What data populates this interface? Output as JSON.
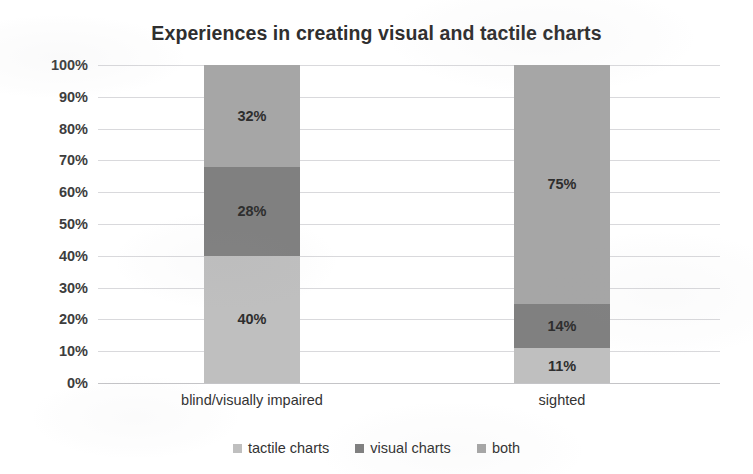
{
  "chart_data": {
    "type": "bar",
    "subtype": "100% stacked column",
    "title": "Experiences in creating visual and tactile charts",
    "subtitle": "",
    "xlabel": "",
    "ylabel": "",
    "categories": [
      "blind/visually impaired",
      "sighted"
    ],
    "series": [
      {
        "name": "tactile charts",
        "color": "#bfbfbf",
        "values": [
          40,
          11
        ],
        "labels": [
          "40%",
          "11%"
        ]
      },
      {
        "name": "visual charts",
        "color": "#808080",
        "values": [
          28,
          14
        ],
        "labels": [
          "28%",
          "14%"
        ]
      },
      {
        "name": "both",
        "color": "#a6a6a6",
        "values": [
          32,
          75
        ],
        "labels": [
          "32%",
          "75%"
        ]
      }
    ],
    "ylim": [
      0,
      100
    ],
    "ytick_values": [
      100,
      90,
      80,
      70,
      60,
      50,
      40,
      30,
      20,
      10,
      0
    ],
    "ytick_labels": [
      "100%",
      "90%",
      "80%",
      "70%",
      "60%",
      "50%",
      "40%",
      "30%",
      "20%",
      "10%",
      "0%"
    ],
    "grid": true,
    "grid_axis": "y",
    "legend_position": "bottom",
    "stack_order_bottom_to_top": [
      "tactile charts",
      "visual charts",
      "both"
    ]
  },
  "colors": {
    "background": "#ffffff",
    "gridline": "#d9d9dc",
    "baseline": "#c4c4c7",
    "title_text": "#2f2f2f",
    "axis_text": "#3d3d3d",
    "label_text": "#2e2e2e",
    "series_tactile": "#bfbfbf",
    "series_visual": "#808080",
    "series_both": "#a6a6a6"
  }
}
